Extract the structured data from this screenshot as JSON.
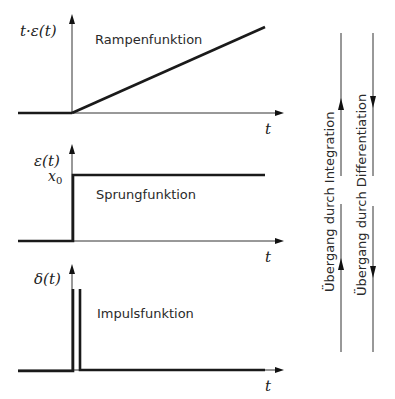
{
  "panels": [
    {
      "id": "ramp",
      "y_label": "t·ε(t)",
      "x_label": "t",
      "title": "Rampenfunktion"
    },
    {
      "id": "step",
      "y_label": "ε(t)",
      "x_label": "t",
      "title": "Sprungfunktion",
      "level_label": "x",
      "level_sub": "0"
    },
    {
      "id": "impulse",
      "y_label": "δ(t)",
      "x_label": "t",
      "title": "Impulsfunktion"
    }
  ],
  "side": {
    "integration": "Übergang durch Integration",
    "differentiation": "Übergang durch Differentiation"
  },
  "colors": {
    "ink": "#1a1a1a",
    "background": "#ffffff"
  }
}
